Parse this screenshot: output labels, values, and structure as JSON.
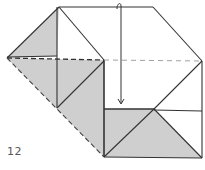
{
  "diagram": {
    "kind": "origami-instruction-step",
    "step_number": "12",
    "colors": {
      "paper_front": "#ffffff",
      "paper_back": "#cfcfcf",
      "line": "#333333",
      "fold_line": "#777777",
      "step_text": "#555555"
    },
    "instruction": {
      "arrow": "fold-down",
      "fold_line": "valley-fold horizontal dashed line across middle",
      "from": [
        121,
        5
      ],
      "to": [
        121,
        104
      ]
    }
  }
}
